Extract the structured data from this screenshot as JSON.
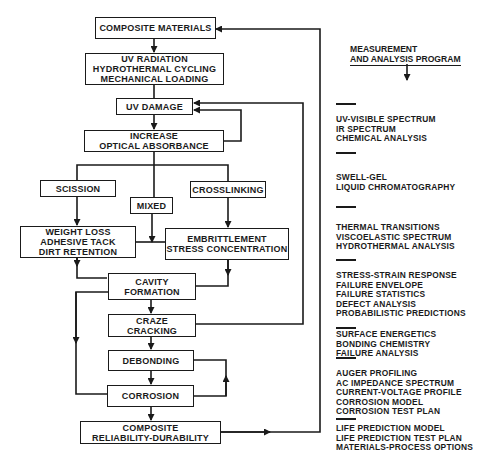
{
  "flowchart": {
    "nodes": {
      "composite_materials": "COMPOSITE MATERIALS",
      "stressors": [
        "UV RADIATION",
        "HYDROTHERMAL CYCLING",
        "MECHANICAL LOADING"
      ],
      "uv_damage": "UV DAMAGE",
      "optical_absorbance": [
        "INCREASE",
        "OPTICAL ABSORBANCE"
      ],
      "scission": "SCISSION",
      "mixed": "MIXED",
      "crosslinking": "CROSSLINKING",
      "weight_loss": [
        "WEIGHT LOSS",
        "ADHESIVE TACK",
        "DIRT RETENTION"
      ],
      "embrittlement": [
        "EMBRITTLEMENT",
        "STRESS CONCENTRATION"
      ],
      "cavity_formation": [
        "CAVITY",
        "FORMATION"
      ],
      "craze_cracking": [
        "CRAZE",
        "CRACKING"
      ],
      "debonding": "DEBONDING",
      "corrosion": "CORROSION",
      "reliability": [
        "COMPOSITE",
        "RELIABILITY-DURABILITY"
      ]
    }
  },
  "measurement_program": {
    "header": [
      "MEASUREMENT",
      "AND ANALYSIS PROGRAM"
    ],
    "groups": [
      [
        "UV-VISIBLE SPECTRUM",
        "IR SPECTRUM",
        "CHEMICAL ANALYSIS"
      ],
      [
        "SWELL-GEL",
        "LIQUID CHROMATOGRAPHY"
      ],
      [
        "THERMAL TRANSITIONS",
        "VISCOELASTIC SPECTRUM",
        "HYDROTHERMAL ANALYSIS"
      ],
      [
        "STRESS-STRAIN RESPONSE",
        "FAILURE ENVELOPE",
        "FAILURE STATISTICS",
        "DEFECT ANALYSIS",
        "PROBABILISTIC PREDICTIONS"
      ],
      [
        "SURFACE ENERGETICS",
        "BONDING CHEMISTRY",
        "FAILURE ANALYSIS"
      ],
      [
        "AUGER PROFILING",
        "AC IMPEDANCE SPECTRUM",
        "CURRENT-VOLTAGE PROFILE",
        "CORROSION MODEL",
        "CORROSION TEST PLAN"
      ],
      [
        "LIFE PREDICTION MODEL",
        "LIFE PREDICTION TEST PLAN",
        "MATERIALS-PROCESS OPTIONS"
      ]
    ]
  }
}
